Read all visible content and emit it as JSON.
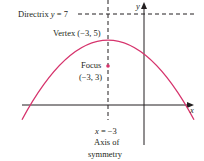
{
  "diagram": {
    "type": "parabola",
    "equation_description": "Downward-opening parabola with vertex (-3, 5), focus (-3, 3), directrix y = 7",
    "colors": {
      "curve": "#d6336c",
      "axes": "#231f20",
      "text": "#231f20"
    },
    "axes": {
      "x_label": "x",
      "y_label": "y"
    },
    "directrix": {
      "label_prefix": "Directrix ",
      "var": "y",
      "label_suffix": " = 7",
      "value": 7
    },
    "vertex": {
      "label": "Vertex (−3, 5)",
      "x": -3,
      "y": 5
    },
    "focus": {
      "label_line1": "Focus",
      "label_line2": "(−3, 3)",
      "x": -3,
      "y": 3
    },
    "axis_of_symmetry": {
      "var": "x",
      "eq_suffix": " = −3",
      "label_line1": "Axis of",
      "label_line2": "symmetry",
      "value": -3
    }
  }
}
